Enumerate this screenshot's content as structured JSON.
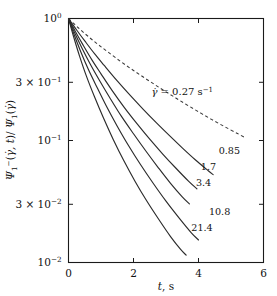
{
  "chart_data": {
    "type": "line",
    "title": "",
    "xlabel": "t, s",
    "ylabel": "Ψ₁⁻(γ̇, t)/ Ψ₁(γ̇)",
    "xlim": [
      0,
      6
    ],
    "ylim": [
      0.01,
      1
    ],
    "yscale": "log",
    "xscale": "linear",
    "grid": false,
    "legend_position": "inline-curve-labels",
    "xticks": [
      "0",
      "2",
      "4",
      "6"
    ],
    "xtick_values": [
      0,
      2,
      4,
      6
    ],
    "yticks": [
      "10⁰",
      "3 × 10⁻¹",
      "10⁻¹",
      "3 × 10⁻²",
      "10⁻²"
    ],
    "ytick_values": [
      1,
      0.3,
      0.1,
      0.03,
      0.01
    ],
    "annotation": {
      "text": "γ̇ = 0.27 s⁻¹",
      "symbol": "γ̇",
      "equals": " = ",
      "value": "0.27 s",
      "exponent": "−1",
      "x": 2.55,
      "y": 0.235
    },
    "series": [
      {
        "name": "0.27",
        "label": "",
        "style": "dashed",
        "x": [
          0.0,
          0.3,
          0.6,
          0.9,
          1.2,
          1.6,
          2.0,
          2.4,
          2.8,
          3.2,
          3.6,
          4.0,
          4.4,
          4.8,
          5.2,
          5.45
        ],
        "y": [
          1.0,
          0.84,
          0.715,
          0.615,
          0.535,
          0.445,
          0.375,
          0.318,
          0.271,
          0.232,
          0.199,
          0.172,
          0.149,
          0.13,
          0.114,
          0.105
        ]
      },
      {
        "name": "0.85",
        "label": "0.85",
        "style": "solid",
        "label_x": 4.62,
        "label_y": 0.083,
        "x": [
          0.0,
          0.25,
          0.5,
          0.8,
          1.1,
          1.5,
          1.9,
          2.3,
          2.7,
          3.1,
          3.5,
          3.9,
          4.3,
          4.45
        ],
        "y": [
          1.0,
          0.805,
          0.655,
          0.515,
          0.412,
          0.308,
          0.234,
          0.18,
          0.14,
          0.11,
          0.087,
          0.0695,
          0.0565,
          0.0525
        ]
      },
      {
        "name": "1.7",
        "label": "1.7",
        "style": "solid",
        "label_x": 4.07,
        "label_y": 0.0612,
        "x": [
          0.0,
          0.22,
          0.45,
          0.72,
          1.0,
          1.35,
          1.72,
          2.1,
          2.5,
          2.9,
          3.3,
          3.7,
          3.95
        ],
        "y": [
          1.0,
          0.775,
          0.605,
          0.458,
          0.352,
          0.255,
          0.186,
          0.138,
          0.1025,
          0.0775,
          0.0595,
          0.0462,
          0.0402
        ]
      },
      {
        "name": "3.4",
        "label": "3.4",
        "style": "solid",
        "label_x": 3.92,
        "label_y": 0.0452,
        "x": [
          0.0,
          0.2,
          0.42,
          0.68,
          0.95,
          1.28,
          1.62,
          2.0,
          2.38,
          2.76,
          3.14,
          3.5,
          3.72
        ],
        "y": [
          1.0,
          0.752,
          0.568,
          0.418,
          0.312,
          0.222,
          0.159,
          0.1135,
          0.082,
          0.06,
          0.0445,
          0.0345,
          0.0302
        ]
      },
      {
        "name": "10.8",
        "label": "10.8",
        "style": "solid",
        "label_x": 4.32,
        "label_y": 0.0262,
        "x": [
          0.0,
          0.18,
          0.38,
          0.62,
          0.88,
          1.18,
          1.5,
          1.85,
          2.22,
          2.6,
          3.0,
          3.4,
          3.78,
          4.0
        ],
        "y": [
          1.0,
          0.728,
          0.532,
          0.378,
          0.272,
          0.188,
          0.131,
          0.0905,
          0.0632,
          0.0448,
          0.0318,
          0.0232,
          0.0175,
          0.0153
        ]
      },
      {
        "name": "21.4",
        "label": "21.4",
        "style": "solid",
        "label_x": 3.78,
        "label_y": 0.0192,
        "x": [
          0.0,
          0.16,
          0.34,
          0.56,
          0.8,
          1.08,
          1.38,
          1.7,
          2.05,
          2.4,
          2.78,
          3.14,
          3.45,
          3.62
        ],
        "y": [
          1.0,
          0.705,
          0.492,
          0.332,
          0.228,
          0.152,
          0.1015,
          0.0685,
          0.0462,
          0.0322,
          0.0225,
          0.0163,
          0.0128,
          0.0115
        ]
      }
    ]
  }
}
